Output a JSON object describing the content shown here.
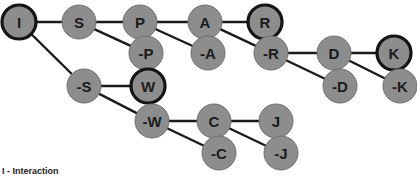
{
  "diagram": {
    "type": "binary-decision-tree",
    "width": 417,
    "height": 180,
    "background_color": "#ffffff",
    "node_fill_color": "#8d8d8d",
    "node_plain_border_color": "#6f6f6f",
    "node_bold_border_color": "#141414",
    "edge_color": "#1a1a1a",
    "label_color": "#1b1b1b",
    "node_radius": 17,
    "nodes": [
      {
        "id": "I",
        "label": "I",
        "x": 19,
        "y": 22,
        "emphasis": "bold"
      },
      {
        "id": "S",
        "label": "S",
        "x": 79,
        "y": 22,
        "emphasis": "plain"
      },
      {
        "id": "P",
        "label": "P",
        "x": 140,
        "y": 22,
        "emphasis": "plain"
      },
      {
        "id": "A",
        "label": "A",
        "x": 205,
        "y": 22,
        "emphasis": "plain"
      },
      {
        "id": "R",
        "label": "R",
        "x": 265,
        "y": 22,
        "emphasis": "bold"
      },
      {
        "id": "not-P",
        "label": "-P",
        "x": 146,
        "y": 53,
        "emphasis": "plain"
      },
      {
        "id": "not-A",
        "label": "-A",
        "x": 208,
        "y": 53,
        "emphasis": "plain"
      },
      {
        "id": "not-R",
        "label": "-R",
        "x": 271,
        "y": 53,
        "emphasis": "plain"
      },
      {
        "id": "D",
        "label": "D",
        "x": 334,
        "y": 53,
        "emphasis": "plain"
      },
      {
        "id": "K",
        "label": "K",
        "x": 394,
        "y": 53,
        "emphasis": "bold"
      },
      {
        "id": "not-D",
        "label": "-D",
        "x": 340,
        "y": 86,
        "emphasis": "plain"
      },
      {
        "id": "not-K",
        "label": "-K",
        "x": 400,
        "y": 86,
        "emphasis": "plain"
      },
      {
        "id": "not-S",
        "label": "-S",
        "x": 84,
        "y": 86,
        "emphasis": "plain"
      },
      {
        "id": "W",
        "label": "W",
        "x": 148,
        "y": 86,
        "emphasis": "bold"
      },
      {
        "id": "not-W",
        "label": "-W",
        "x": 152,
        "y": 121,
        "emphasis": "plain"
      },
      {
        "id": "C",
        "label": "C",
        "x": 214,
        "y": 121,
        "emphasis": "plain"
      },
      {
        "id": "J",
        "label": "J",
        "x": 276,
        "y": 121,
        "emphasis": "plain"
      },
      {
        "id": "not-C",
        "label": "-C",
        "x": 219,
        "y": 153,
        "emphasis": "plain"
      },
      {
        "id": "not-J",
        "label": "-J",
        "x": 281,
        "y": 153,
        "emphasis": "plain"
      }
    ],
    "edges": [
      {
        "from": "I",
        "to": "S"
      },
      {
        "from": "I",
        "to": "not-S"
      },
      {
        "from": "S",
        "to": "P"
      },
      {
        "from": "S",
        "to": "not-P"
      },
      {
        "from": "P",
        "to": "A"
      },
      {
        "from": "P",
        "to": "not-A"
      },
      {
        "from": "A",
        "to": "R"
      },
      {
        "from": "A",
        "to": "not-R"
      },
      {
        "from": "not-R",
        "to": "D"
      },
      {
        "from": "not-R",
        "to": "not-D"
      },
      {
        "from": "D",
        "to": "K"
      },
      {
        "from": "D",
        "to": "not-K"
      },
      {
        "from": "not-S",
        "to": "W"
      },
      {
        "from": "not-S",
        "to": "not-W"
      },
      {
        "from": "not-W",
        "to": "C"
      },
      {
        "from": "not-W",
        "to": "not-C"
      },
      {
        "from": "C",
        "to": "J"
      },
      {
        "from": "C",
        "to": "not-J"
      }
    ]
  },
  "caption": {
    "text": "I - Interaction"
  }
}
